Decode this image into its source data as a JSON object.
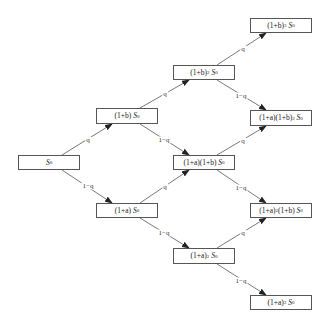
{
  "diagram": {
    "up_label": "q",
    "down_label": "1−q",
    "line_color": "#555555",
    "nodes": [
      {
        "id": "n0",
        "base": "",
        "exp1": "",
        "mid": "",
        "exp2": "",
        "symbol": "S",
        "sub": "0",
        "x": 18,
        "y": 155,
        "w": 62,
        "h": 15
      },
      {
        "id": "nb",
        "base": "(1+b)",
        "exp1": "",
        "mid": "",
        "exp2": "",
        "symbol": "S",
        "sub": "0",
        "x": 96,
        "y": 108,
        "w": 62,
        "h": 16
      },
      {
        "id": "na",
        "base": "(1+a)",
        "exp1": "",
        "mid": "",
        "exp2": "",
        "symbol": "S",
        "sub": "0",
        "x": 96,
        "y": 203,
        "w": 62,
        "h": 15
      },
      {
        "id": "nbb",
        "base": "(1+b)",
        "exp1": "2",
        "mid": "",
        "exp2": "",
        "symbol": "S",
        "sub": "0",
        "x": 173,
        "y": 65,
        "w": 62,
        "h": 15
      },
      {
        "id": "nab",
        "base": "(1+a)",
        "exp1": "",
        "mid": " (1+b)",
        "exp2": "",
        "symbol": "S",
        "sub": "0",
        "x": 173,
        "y": 155,
        "w": 62,
        "h": 15
      },
      {
        "id": "naa",
        "base": "(1+a)",
        "exp1": "2",
        "mid": "",
        "exp2": "",
        "symbol": "S",
        "sub": "0",
        "x": 173,
        "y": 248,
        "w": 62,
        "h": 16
      },
      {
        "id": "nbbb",
        "base": "(1+b)",
        "exp1": "3",
        "mid": "",
        "exp2": "",
        "symbol": "S",
        "sub": "0",
        "x": 250,
        "y": 18,
        "w": 62,
        "h": 15
      },
      {
        "id": "nabb",
        "base": "(1+a)",
        "exp1": "",
        "mid": " (1+b)",
        "exp2": "2",
        "symbol": "S",
        "sub": "0",
        "x": 250,
        "y": 110,
        "w": 62,
        "h": 16
      },
      {
        "id": "naab",
        "base": "(1+a)",
        "exp1": "2",
        "mid": " (1+b)",
        "exp2": "",
        "symbol": "S",
        "sub": "0",
        "x": 250,
        "y": 203,
        "w": 62,
        "h": 15
      },
      {
        "id": "naaa",
        "base": "(1+a)",
        "exp1": "3",
        "mid": "",
        "exp2": "",
        "symbol": "S",
        "sub": "0",
        "x": 250,
        "y": 295,
        "w": 62,
        "h": 15
      }
    ],
    "edges": [
      {
        "from": "n0",
        "to": "nb",
        "dir": "up",
        "label": "q",
        "x1": 62,
        "y1": 155,
        "x2": 112,
        "y2": 124,
        "lx": 88,
        "ly": 140
      },
      {
        "from": "n0",
        "to": "na",
        "dir": "down",
        "label": "1−q",
        "x1": 62,
        "y1": 170,
        "x2": 112,
        "y2": 203,
        "lx": 88,
        "ly": 186
      },
      {
        "from": "nb",
        "to": "nbb",
        "dir": "up",
        "label": "q",
        "x1": 140,
        "y1": 108,
        "x2": 189,
        "y2": 80,
        "lx": 165,
        "ly": 94
      },
      {
        "from": "nb",
        "to": "nab",
        "dir": "down",
        "label": "1−q",
        "x1": 140,
        "y1": 124,
        "x2": 189,
        "y2": 155,
        "lx": 164,
        "ly": 140
      },
      {
        "from": "na",
        "to": "nab",
        "dir": "up",
        "label": "q",
        "x1": 140,
        "y1": 203,
        "x2": 189,
        "y2": 170,
        "lx": 165,
        "ly": 187
      },
      {
        "from": "na",
        "to": "naa",
        "dir": "down",
        "label": "1−q",
        "x1": 140,
        "y1": 218,
        "x2": 189,
        "y2": 248,
        "lx": 164,
        "ly": 233
      },
      {
        "from": "nbb",
        "to": "nbbb",
        "dir": "up",
        "label": "q",
        "x1": 217,
        "y1": 65,
        "x2": 266,
        "y2": 33,
        "lx": 243,
        "ly": 49
      },
      {
        "from": "nbb",
        "to": "nabb",
        "dir": "down",
        "label": "1−q",
        "x1": 217,
        "y1": 80,
        "x2": 266,
        "y2": 110,
        "lx": 241,
        "ly": 96
      },
      {
        "from": "nab",
        "to": "nabb",
        "dir": "up",
        "label": "q",
        "x1": 217,
        "y1": 155,
        "x2": 266,
        "y2": 126,
        "lx": 243,
        "ly": 141
      },
      {
        "from": "nab",
        "to": "naab",
        "dir": "down",
        "label": "1−q",
        "x1": 217,
        "y1": 170,
        "x2": 266,
        "y2": 203,
        "lx": 241,
        "ly": 188
      },
      {
        "from": "naa",
        "to": "naab",
        "dir": "up",
        "label": "q",
        "x1": 217,
        "y1": 248,
        "x2": 266,
        "y2": 218,
        "lx": 243,
        "ly": 233
      },
      {
        "from": "naa",
        "to": "naaa",
        "dir": "down",
        "label": "1−q",
        "x1": 217,
        "y1": 264,
        "x2": 266,
        "y2": 295,
        "lx": 241,
        "ly": 281
      }
    ]
  }
}
